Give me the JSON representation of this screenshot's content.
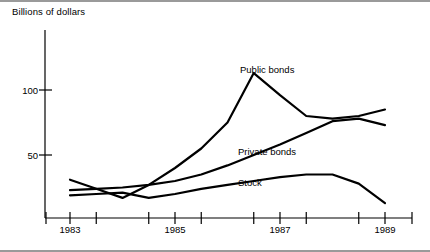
{
  "figure": {
    "ylabel": "Billions of dollars",
    "y_ticks": [
      {
        "value": 100,
        "label": "100"
      },
      {
        "value": 50,
        "label": "50"
      }
    ],
    "x_ticks": [
      {
        "value": 1983,
        "label": "1983"
      },
      {
        "value": 1985,
        "label": "1985"
      },
      {
        "value": 1987,
        "label": "1987"
      },
      {
        "value": 1989,
        "label": "1989"
      }
    ],
    "series_labels": [
      {
        "name": "public-bonds",
        "label": "Public bonds"
      },
      {
        "name": "private-bonds",
        "label": "Private bonds"
      },
      {
        "name": "stock",
        "label": "Stock"
      }
    ],
    "line_color": "#000000",
    "frame_color": "#9a9a9a"
  },
  "chart_data": {
    "type": "line",
    "title": "",
    "subtitle": "",
    "xlabel": "",
    "ylabel": "Billions of dollars",
    "xlim": [
      1983,
      1989
    ],
    "ylim": [
      0,
      130
    ],
    "yticks": [
      50,
      100
    ],
    "xticks": [
      1983,
      1985,
      1987,
      1989
    ],
    "minor_xticks": [
      1983.5,
      1984.5,
      1985.5,
      1986.5,
      1987.5,
      1988.5
    ],
    "grid": false,
    "legend": "inline-annotations",
    "x": [
      1983,
      1983.5,
      1984,
      1984.5,
      1985,
      1985.5,
      1986,
      1986.5,
      1987,
      1987.5,
      1988,
      1988.5,
      1989
    ],
    "series": [
      {
        "name": "Public bonds",
        "label_position": {
          "x": 1986.9,
          "y": 108
        },
        "values": [
          31,
          24,
          17,
          27,
          40,
          55,
          75,
          113,
          96,
          80,
          78,
          80,
          85
        ]
      },
      {
        "name": "Private bonds",
        "label_position": {
          "x": 1986.6,
          "y": 56
        },
        "values": [
          23,
          24,
          25,
          27,
          30,
          35,
          42,
          50,
          58,
          67,
          76,
          78,
          73
        ]
      },
      {
        "name": "Stock",
        "label_position": {
          "x": 1986.2,
          "y": 30
        },
        "values": [
          19,
          20,
          21,
          17,
          20,
          24,
          27,
          30,
          33,
          35,
          35,
          28,
          13
        ]
      }
    ]
  }
}
